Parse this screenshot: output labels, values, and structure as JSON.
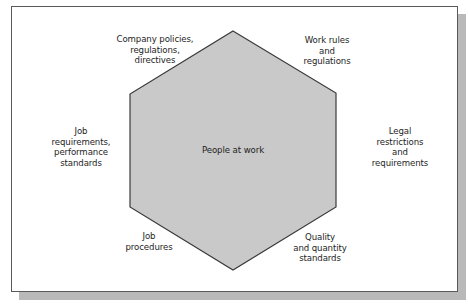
{
  "diagram": {
    "type": "hexagon-influence-diagram",
    "center": {
      "label": "People at work"
    },
    "labels": [
      {
        "id": "company-policies",
        "text": "Company policies,\nregulations,\ndirectives",
        "position": "top-left"
      },
      {
        "id": "work-rules",
        "text": "Work rules\nand\nregulations",
        "position": "top-right"
      },
      {
        "id": "job-requirements",
        "text": "Job\nrequirements,\nperformance\nstandards",
        "position": "left"
      },
      {
        "id": "legal-restrictions",
        "text": "Legal\nrestrictions\nand\nrequirements",
        "position": "right"
      },
      {
        "id": "job-procedures",
        "text": "Job\nprocedures",
        "position": "bottom-left"
      },
      {
        "id": "quality-standards",
        "text": "Quality\nand quantity\nstandards",
        "position": "bottom-right"
      }
    ],
    "colors": {
      "hexagon_fill": "#c9c9c9",
      "hexagon_stroke": "#3a3a3a",
      "frame_border": "#5a5a5a",
      "shadow": "#b9b9b9",
      "background": "#ffffff",
      "text": "#1e1e1e"
    }
  }
}
